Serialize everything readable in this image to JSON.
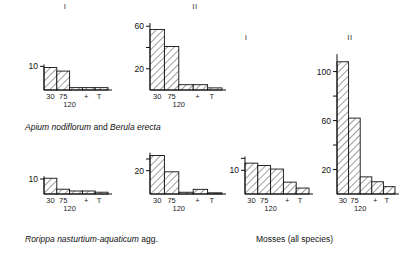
{
  "figure": {
    "column_headers": [
      {
        "label": "I"
      },
      {
        "label": "II"
      },
      {
        "label": "I"
      },
      {
        "label": "II"
      }
    ],
    "captions": [
      {
        "part1": "Apium nodiflorum",
        "joiner": " and ",
        "part2": "Berula erecta"
      },
      {
        "part1": "Rorippa nasturtium-aquaticum",
        "joiner": " agg.",
        "part2": ""
      },
      {
        "part1": "Mosses (all species)",
        "joiner": "",
        "part2": ""
      }
    ],
    "x_tick_labels": [
      "30",
      "75",
      "+",
      "T"
    ],
    "x_tick_second_row": "120"
  },
  "chart_data": [
    {
      "id": "apium-I",
      "type": "bar",
      "title": "I",
      "group": "Apium nodiflorum and Berula erecta",
      "categories": [
        "30",
        "75",
        "120",
        "+",
        "T"
      ],
      "values": [
        9.5,
        8.0,
        1.0,
        1.0,
        1.0
      ],
      "ylabel": "",
      "xlabel": "",
      "ytick_values": [
        10
      ],
      "ytick_labels": [
        "10"
      ],
      "ylim": [
        0,
        11
      ],
      "grid": false
    },
    {
      "id": "apium-II",
      "type": "bar",
      "title": "II",
      "group": "Apium nodiflorum and Berula erecta",
      "categories": [
        "30",
        "75",
        "120",
        "+",
        "T"
      ],
      "values": [
        57,
        41,
        5,
        5,
        2
      ],
      "ylabel": "",
      "xlabel": "",
      "ytick_values": [
        20,
        40,
        60
      ],
      "ytick_labels": [
        "20",
        "",
        "60"
      ],
      "ylim": [
        0,
        64
      ],
      "grid": false
    },
    {
      "id": "rorippa-I",
      "type": "bar",
      "title": "I",
      "group": "Rorippa nasturtium-aquaticum agg.",
      "categories": [
        "30",
        "75",
        "120",
        "+",
        "T"
      ],
      "values": [
        10.5,
        3.2,
        2.0,
        2.0,
        1.2
      ],
      "ylabel": "",
      "xlabel": "",
      "ytick_values": [
        10
      ],
      "ytick_labels": [
        "10"
      ],
      "ylim": [
        0,
        12
      ],
      "grid": false
    },
    {
      "id": "rorippa-II",
      "type": "bar",
      "title": "II",
      "group": "Rorippa nasturtium-aquaticum agg.",
      "categories": [
        "30",
        "75",
        "120",
        "+",
        "T"
      ],
      "values": [
        33,
        19,
        1.5,
        4.0,
        1.0
      ],
      "ylabel": "",
      "xlabel": "",
      "ytick_values": [
        20,
        30
      ],
      "ytick_labels": [
        "20",
        ""
      ],
      "ylim": [
        0,
        36
      ],
      "grid": false
    },
    {
      "id": "mosses-I",
      "type": "bar",
      "title": "I",
      "group": "Mosses (all species)",
      "categories": [
        "30",
        "75",
        "120",
        "+",
        "T"
      ],
      "values": [
        13.0,
        12.0,
        10.5,
        5.0,
        2.5
      ],
      "ylabel": "",
      "xlabel": "",
      "ytick_values": [
        10,
        15
      ],
      "ytick_labels": [
        "10",
        ""
      ],
      "ylim": [
        0,
        16
      ],
      "grid": false
    },
    {
      "id": "mosses-II",
      "type": "bar",
      "title": "II",
      "group": "Mosses (all species)",
      "categories": [
        "30",
        "75",
        "120",
        "+",
        "T"
      ],
      "values": [
        108,
        62,
        14,
        10,
        6
      ],
      "ylabel": "",
      "xlabel": "",
      "ytick_values": [
        20,
        40,
        60,
        80,
        100
      ],
      "ytick_labels": [
        "20",
        "",
        "60",
        "",
        "100"
      ],
      "ylim": [
        0,
        116
      ],
      "grid": false
    }
  ],
  "style": {
    "line_color": "#111111",
    "hatch_color": "#3a3a3a",
    "background": "#ffffff"
  }
}
